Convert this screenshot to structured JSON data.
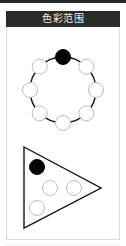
{
  "header": {
    "title": "色彩范围"
  },
  "colors": {
    "header_bg": "#2b2b2b",
    "header_text": "#f2f2f2",
    "panel_border": "#dcdcdc",
    "stroke": "#111111",
    "filled": "#000000",
    "empty_fill": "#ffffff",
    "empty_stroke": "#bdbdbd"
  },
  "diagram": {
    "ring": {
      "center": [
        63,
        90
      ],
      "radius": 33,
      "circle_count": 8,
      "circle_radius": 7.5,
      "filled_index": 0,
      "circles": [
        {
          "position": "top",
          "filled": true
        },
        {
          "position": "top-right",
          "filled": false
        },
        {
          "position": "right",
          "filled": false
        },
        {
          "position": "bottom-right",
          "filled": false
        },
        {
          "position": "bottom",
          "filled": false
        },
        {
          "position": "bottom-left",
          "filled": false
        },
        {
          "position": "left",
          "filled": false
        },
        {
          "position": "top-left",
          "filled": false
        }
      ]
    },
    "triangle": {
      "vertices": [
        [
          24,
          147
        ],
        [
          101,
          188
        ],
        [
          24,
          228
        ]
      ],
      "circles": [
        {
          "cx": 37,
          "cy": 167,
          "filled": true
        },
        {
          "cx": 50,
          "cy": 188,
          "filled": false
        },
        {
          "cx": 74,
          "cy": 188,
          "filled": false
        },
        {
          "cx": 37,
          "cy": 208,
          "filled": false
        }
      ]
    }
  }
}
